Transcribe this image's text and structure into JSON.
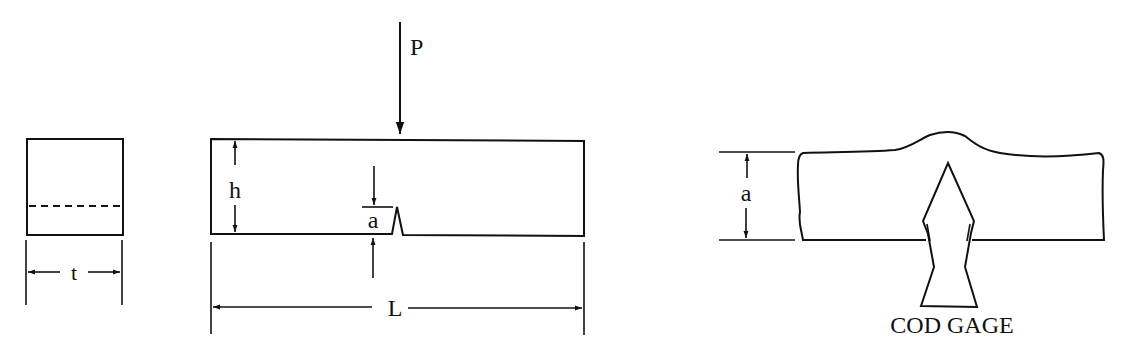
{
  "figure": {
    "type": "fracture test specimen schematic",
    "panels": [
      {
        "id": "cross-section",
        "labels": {
          "thickness": "t"
        }
      },
      {
        "id": "beam",
        "labels": {
          "load": "P",
          "height": "h",
          "crack_depth": "a",
          "length": "L"
        }
      },
      {
        "id": "cod-detail",
        "labels": {
          "crack_depth": "a",
          "gage": "COD GAGE"
        }
      }
    ]
  },
  "labels": {
    "t": "t",
    "P": "P",
    "h": "h",
    "a_beam": "a",
    "L": "L",
    "a_detail": "a",
    "cod_gage": "COD GAGE"
  },
  "colors": {
    "line": "#111111",
    "background": "#ffffff"
  }
}
